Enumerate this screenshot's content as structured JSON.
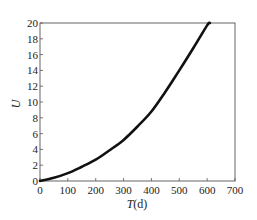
{
  "chart_data": {
    "type": "line",
    "title": "",
    "xlabel": "T(d)",
    "xlabel_italic_part": "T",
    "xlabel_unit": "(d)",
    "ylabel": "U",
    "xlim": [
      0,
      700
    ],
    "ylim": [
      0,
      20
    ],
    "grid": false,
    "legend": null,
    "x_ticks": [
      0,
      100,
      200,
      300,
      400,
      500,
      600,
      700
    ],
    "y_ticks": [
      0,
      2,
      4,
      6,
      8,
      10,
      12,
      14,
      16,
      18,
      20
    ],
    "series": [
      {
        "name": "U",
        "color": "#111111",
        "x": [
          0,
          50,
          100,
          150,
          200,
          250,
          300,
          350,
          400,
          450,
          500,
          550,
          600,
          610
        ],
        "y": [
          0,
          0.4,
          1.0,
          1.8,
          2.7,
          3.9,
          5.2,
          6.9,
          8.8,
          11.3,
          14.0,
          16.8,
          19.7,
          20.0
        ]
      }
    ]
  }
}
